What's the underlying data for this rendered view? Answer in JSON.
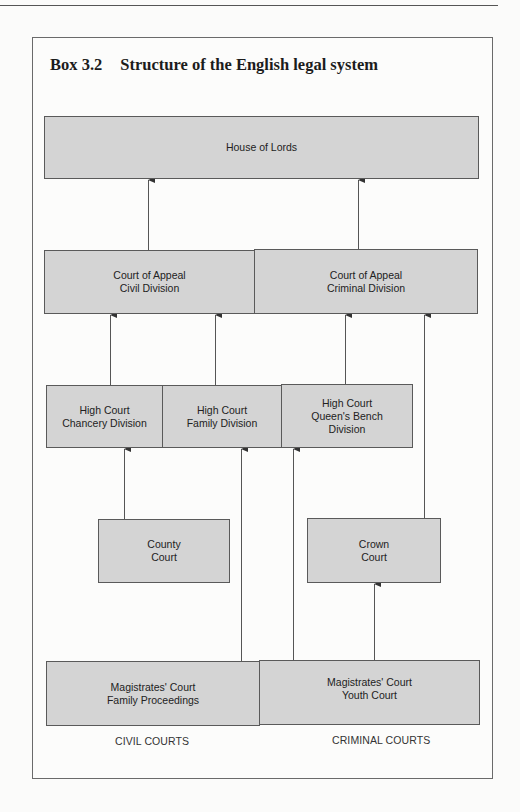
{
  "box": {
    "number": "Box 3.2",
    "title": "Structure of the English legal system"
  },
  "nodes": {
    "house_of_lords": {
      "line1": "House of Lords"
    },
    "coa_civil": {
      "line1": "Court of Appeal",
      "line2": "Civil Division"
    },
    "coa_criminal": {
      "line1": "Court of Appeal",
      "line2": "Criminal Division"
    },
    "hc_chancery": {
      "line1": "High Court",
      "line2": "Chancery Division"
    },
    "hc_family": {
      "line1": "High Court",
      "line2": "Family Division"
    },
    "hc_qb": {
      "line1": "High Court",
      "line2": "Queen's Bench",
      "line3": "Division"
    },
    "county": {
      "line1": "County",
      "line2": "Court"
    },
    "crown": {
      "line1": "Crown",
      "line2": "Court"
    },
    "mag_family": {
      "line1": "Magistrates' Court",
      "line2": "Family Proceedings"
    },
    "mag_youth": {
      "line1": "Magistrates' Court",
      "line2": "Youth Court"
    }
  },
  "edges": [
    {
      "from": "Court of Appeal Civil Division",
      "to": "House of Lords"
    },
    {
      "from": "Court of Appeal Criminal Division",
      "to": "House of Lords"
    },
    {
      "from": "High Court Chancery Division",
      "to": "Court of Appeal Civil Division"
    },
    {
      "from": "High Court Family Division",
      "to": "Court of Appeal Civil Division"
    },
    {
      "from": "High Court Queen's Bench Division",
      "to": "Court of Appeal Criminal Division"
    },
    {
      "from": "Crown Court",
      "to": "Court of Appeal Criminal Division"
    },
    {
      "from": "County Court",
      "to": "High Court Chancery Division"
    },
    {
      "from": "Magistrates' Court Family Proceedings",
      "to": "High Court Family Division"
    },
    {
      "from": "Magistrates' Court Youth Court",
      "to": "High Court Queen's Bench Division"
    },
    {
      "from": "Magistrates' Court Youth Court",
      "to": "Crown Court"
    }
  ],
  "footer": {
    "civil": "CIVIL COURTS",
    "criminal": "CRIMINAL COURTS"
  },
  "colors": {
    "node_fill": "#d4d4d4",
    "node_border": "#5a5a5a",
    "line": "#555555"
  }
}
